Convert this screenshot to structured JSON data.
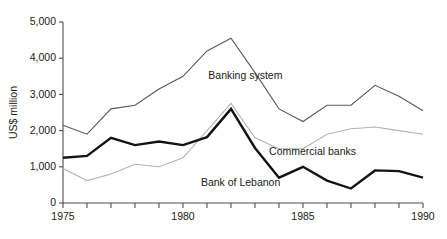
{
  "chart_data": {
    "type": "line",
    "title": "",
    "xlabel": "",
    "ylabel": "US$ million",
    "xlim": [
      1975,
      1990
    ],
    "ylim": [
      0,
      5000
    ],
    "grid": false,
    "legend_position": "inline-annotations",
    "x": [
      1975,
      1976,
      1977,
      1978,
      1979,
      1980,
      1981,
      1982,
      1983,
      1984,
      1985,
      1986,
      1987,
      1988,
      1989,
      1990
    ],
    "x_tick_labels": [
      "1975",
      "",
      "",
      "",
      "",
      "1980",
      "",
      "",
      "",
      "",
      "1985",
      "",
      "",
      "",
      "",
      "1990"
    ],
    "y_tick_labels": [
      "0",
      "1,000",
      "2,000",
      "3,000",
      "4,000",
      "5,000"
    ],
    "y_ticks": [
      0,
      1000,
      2000,
      3000,
      4000,
      5000
    ],
    "series": [
      {
        "name": "Banking system",
        "color": "#595959",
        "width": 1.1,
        "label_x": 1982.6,
        "label_y": 3430,
        "values": [
          2150,
          1900,
          2600,
          2700,
          3150,
          3500,
          4200,
          4550,
          3600,
          2600,
          2250,
          2700,
          2700,
          3250,
          2950,
          2550
        ]
      },
      {
        "name": "Commercial banks",
        "color": "#b3b3b3",
        "width": 1.1,
        "label_x": 1985.4,
        "label_y": 1330,
        "values": [
          950,
          620,
          800,
          1070,
          1000,
          1250,
          2000,
          2750,
          1800,
          1500,
          1500,
          1900,
          2050,
          2100,
          2000,
          1900
        ]
      },
      {
        "name": "Bank of Lebanon",
        "color": "#141414",
        "width": 2.4,
        "label_x": 1982.4,
        "label_y": 470,
        "values": [
          1250,
          1300,
          1800,
          1600,
          1700,
          1600,
          1820,
          2600,
          1520,
          1550,
          1580,
          1520,
          1480,
          1500,
          1450,
          1400
        ]
      }
    ],
    "series_overrides": {
      "Bank of Lebanon": [
        1250,
        1300,
        1800,
        1600,
        1700,
        1600,
        1820,
        2600,
        1520,
        700,
        1000,
        620,
        400,
        900,
        880,
        700
      ]
    },
    "annotations": [
      {
        "text": "Banking system",
        "x": 1982.6,
        "y": 3430
      },
      {
        "text": "Commercial banks",
        "x": 1985.4,
        "y": 1330
      },
      {
        "text": "Bank of Lebanon",
        "x": 1982.4,
        "y": 470
      }
    ]
  }
}
